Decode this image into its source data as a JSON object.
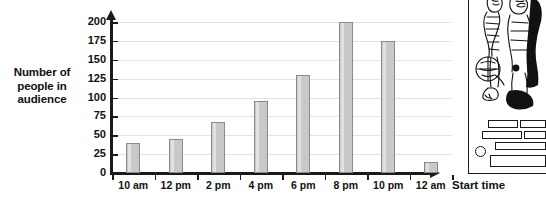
{
  "chart_data": {
    "type": "bar",
    "title": "",
    "xlabel": "Start time",
    "ylabel": "Number of people in audience",
    "categories": [
      "10 am",
      "12 pm",
      "2 pm",
      "4 pm",
      "6 pm",
      "8 pm",
      "10 pm",
      "12 am"
    ],
    "values": [
      40,
      45,
      67,
      95,
      130,
      200,
      175,
      15
    ],
    "ylim": [
      0,
      200
    ],
    "ytick_labels": [
      "0",
      "25",
      "50",
      "75",
      "100",
      "125",
      "150",
      "175",
      "200"
    ],
    "ytick_values": [
      0,
      25,
      50,
      75,
      100,
      125,
      150,
      175,
      200
    ],
    "grid": true,
    "legend": "none",
    "bar_fill_color": "#c9c9c9",
    "bar_border_color": "#8a8a8a",
    "axis_color": "#1a1a1a",
    "gridline_color": "#e3e3e3"
  },
  "axis_titles": {
    "y_line_1": "Number of",
    "y_line_2": "people in",
    "y_line_3": "audience",
    "x": "Start time"
  },
  "illustration": {
    "name": "line-art-figure-panel",
    "description": "partial black-and-white line drawing of costumed figures with text bars below"
  }
}
